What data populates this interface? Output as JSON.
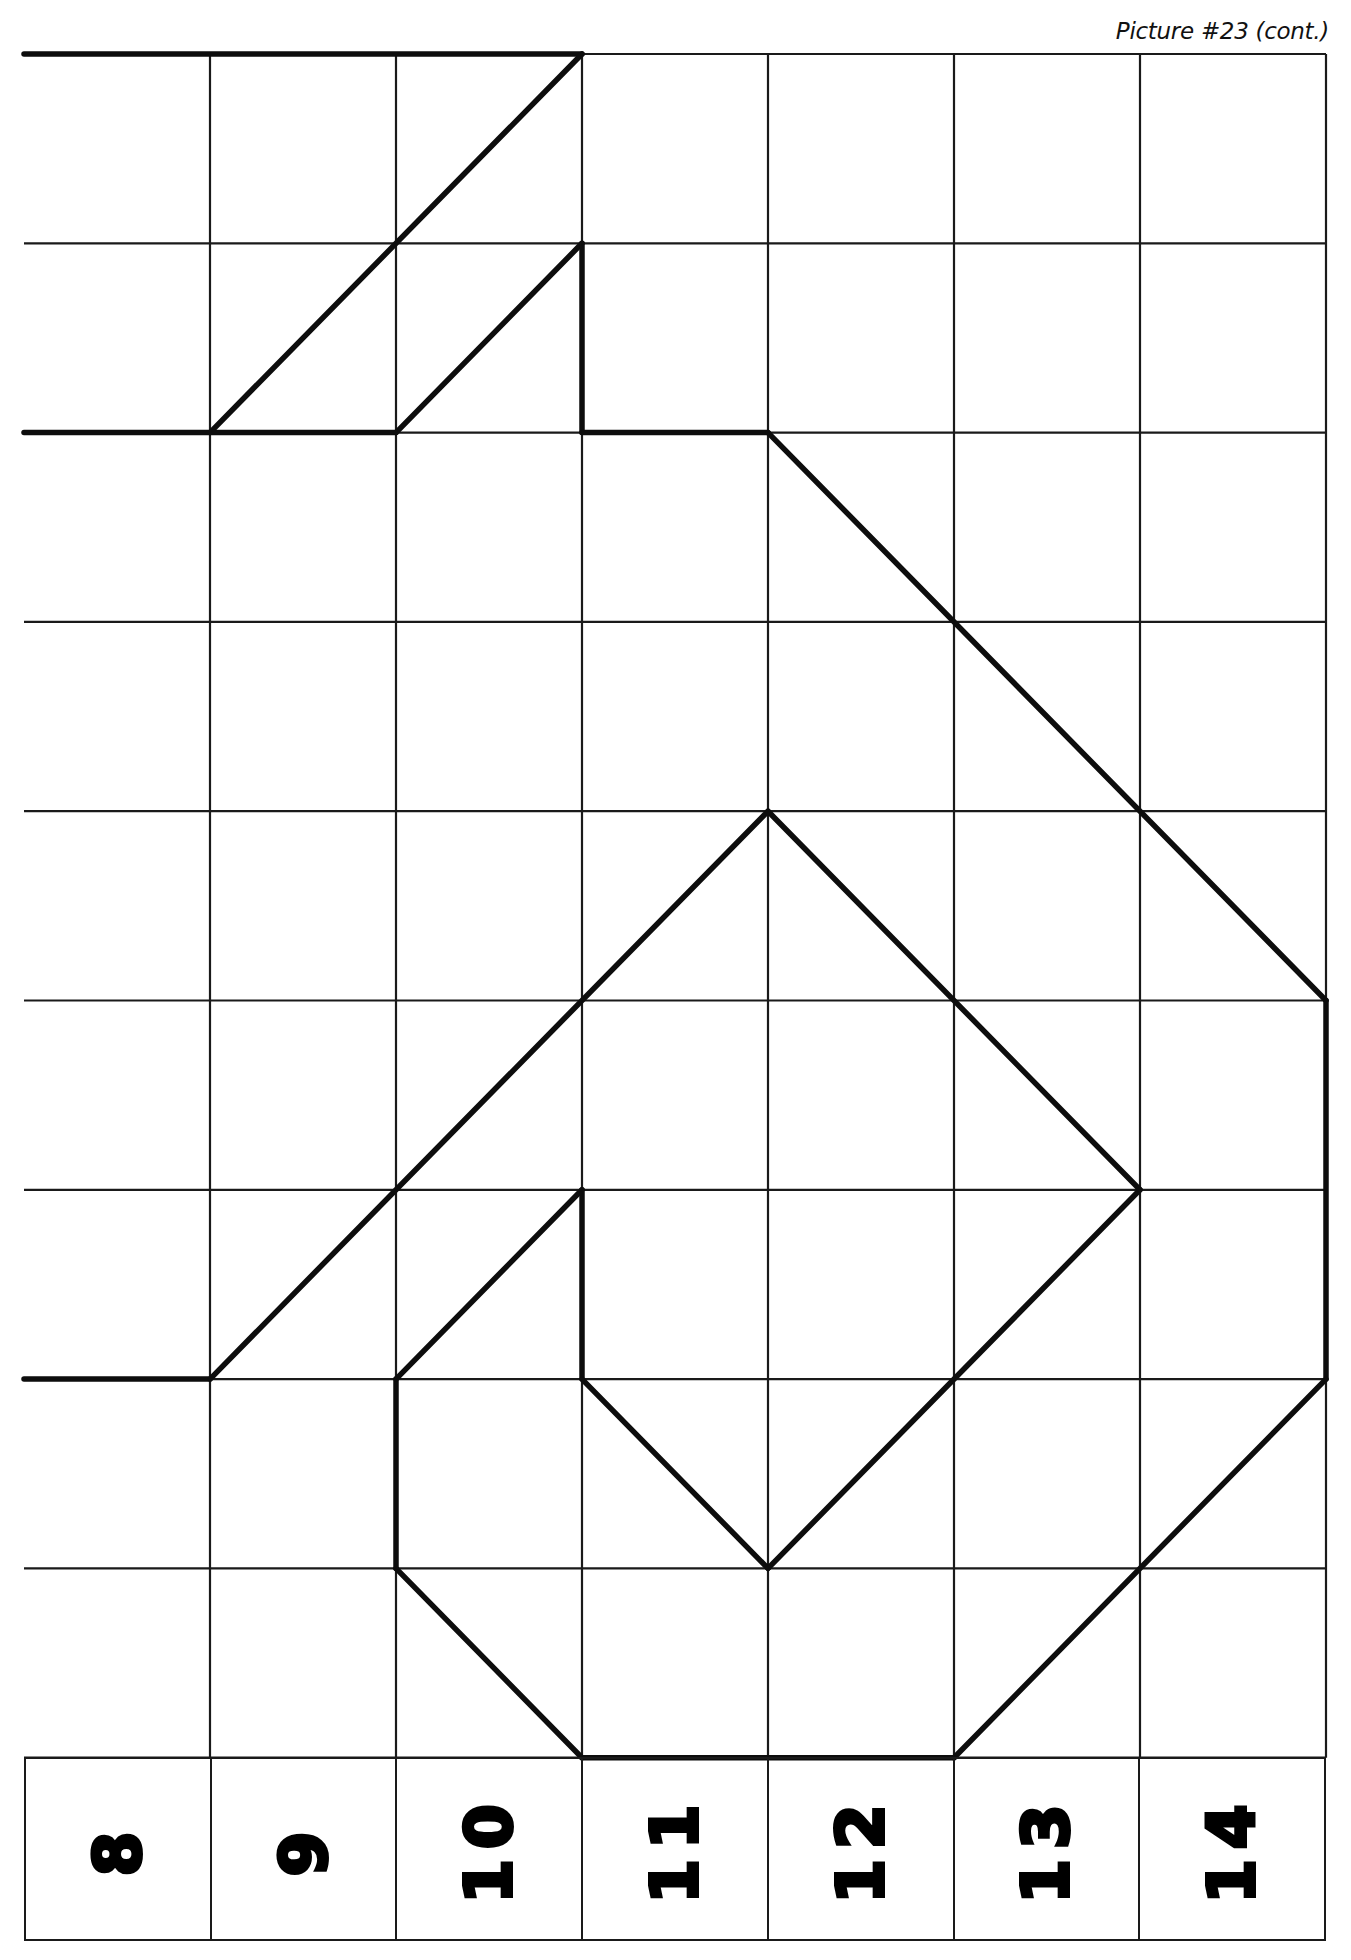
{
  "header": {
    "caption": "Picture #23 (cont.)"
  },
  "grid": {
    "origin_x": 24,
    "origin_y": 54,
    "col_width": 186.0,
    "row_height": 189.3,
    "cols": 7,
    "rows": 9,
    "line_color": "#1a1a1a",
    "draw_color": "#0d0d0d"
  },
  "column_labels": [
    "8",
    "9",
    "10",
    "11",
    "12",
    "13",
    "14"
  ],
  "label_row": {
    "top": 1757,
    "height": 184
  },
  "chart_data": {
    "type": "grid-drawing",
    "title": "Picture #23 (cont.)",
    "columns": [
      "8",
      "9",
      "10",
      "11",
      "12",
      "13",
      "14"
    ],
    "rows": 9,
    "coordinate_note": "Points are [col_line, row_line] with col 0 = left edge, row 0 = top edge",
    "segments": [
      [
        [
          0,
          0
        ],
        [
          3,
          0
        ]
      ],
      [
        [
          3,
          0
        ],
        [
          1,
          2
        ]
      ],
      [
        [
          0,
          2
        ],
        [
          2,
          2
        ]
      ],
      [
        [
          2,
          2
        ],
        [
          3,
          1
        ]
      ],
      [
        [
          3,
          1
        ],
        [
          3,
          2
        ]
      ],
      [
        [
          3,
          2
        ],
        [
          4,
          2
        ]
      ],
      [
        [
          4,
          2
        ],
        [
          7,
          5
        ]
      ],
      [
        [
          7,
          5
        ],
        [
          7,
          7
        ]
      ],
      [
        [
          7,
          7
        ],
        [
          5,
          9
        ]
      ],
      [
        [
          5,
          9
        ],
        [
          3,
          9
        ]
      ],
      [
        [
          3,
          9
        ],
        [
          2,
          8
        ]
      ],
      [
        [
          2,
          8
        ],
        [
          2,
          7
        ]
      ],
      [
        [
          2,
          7
        ],
        [
          3,
          6
        ]
      ],
      [
        [
          3,
          6
        ],
        [
          3,
          7
        ]
      ],
      [
        [
          3,
          7
        ],
        [
          4,
          8
        ]
      ],
      [
        [
          4,
          8
        ],
        [
          6,
          6
        ]
      ],
      [
        [
          6,
          6
        ],
        [
          4,
          4
        ]
      ],
      [
        [
          4,
          4
        ],
        [
          1,
          7
        ]
      ],
      [
        [
          1,
          7
        ],
        [
          0,
          7
        ]
      ]
    ]
  }
}
